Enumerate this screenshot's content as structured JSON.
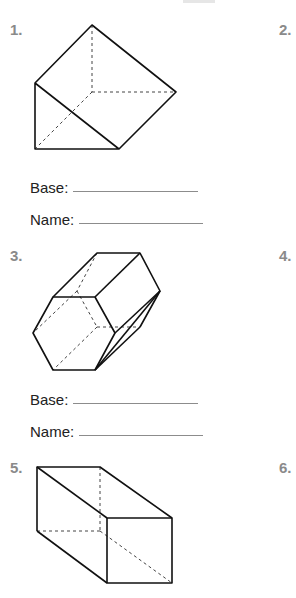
{
  "worksheet": {
    "problems": [
      {
        "number": "1.",
        "shape": "triangular-prism",
        "base_label": "Base:",
        "name_label": "Name:",
        "base_value": "",
        "name_value": ""
      },
      {
        "number": "2."
      },
      {
        "number": "3.",
        "shape": "hexagonal-prism",
        "base_label": "Base:",
        "name_label": "Name:",
        "base_value": "",
        "name_value": ""
      },
      {
        "number": "4."
      },
      {
        "number": "5.",
        "shape": "rectangular-prism"
      },
      {
        "number": "6."
      }
    ],
    "colors": {
      "number_label": "#8a8a8a",
      "text": "#222222",
      "line": "#111111",
      "blank_line": "#8c8c8c"
    }
  }
}
